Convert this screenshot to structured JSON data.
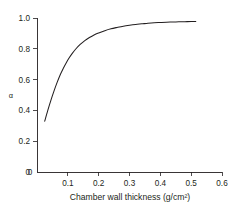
{
  "chart_data": {
    "type": "line",
    "title": "",
    "subtitle": "",
    "xlabel": "Chamber wall thickness (g/cm²)",
    "ylabel": "α",
    "xlim": [
      0.0,
      0.6
    ],
    "ylim": [
      0.0,
      1.0
    ],
    "xticks": [
      0.0,
      0.1,
      0.2,
      0.3,
      0.4,
      0.5,
      0.6
    ],
    "xtick_labels": [
      "0",
      "0.1",
      "0.2",
      "0.3",
      "0.4",
      "0.5",
      "0.6"
    ],
    "yticks": [
      0.0,
      0.2,
      0.4,
      0.6,
      0.8,
      1.0
    ],
    "ytick_labels": [
      "0",
      "0.2",
      "0.4",
      "0.6",
      "0.8",
      "1.0"
    ],
    "grid": false,
    "legend": false,
    "legend_position": "none",
    "series": [
      {
        "name": "alpha vs chamber wall thickness",
        "color": "#231f20",
        "x": [
          0.025,
          0.035,
          0.045,
          0.055,
          0.065,
          0.075,
          0.085,
          0.095,
          0.105,
          0.115,
          0.125,
          0.14,
          0.155,
          0.17,
          0.185,
          0.2,
          0.22,
          0.24,
          0.26,
          0.28,
          0.3,
          0.32,
          0.34,
          0.36,
          0.38,
          0.4,
          0.42,
          0.44,
          0.46,
          0.48,
          0.5,
          0.515
        ],
        "y": [
          0.33,
          0.4,
          0.465,
          0.525,
          0.58,
          0.63,
          0.672,
          0.71,
          0.743,
          0.772,
          0.797,
          0.828,
          0.853,
          0.873,
          0.89,
          0.903,
          0.918,
          0.93,
          0.939,
          0.947,
          0.953,
          0.958,
          0.962,
          0.966,
          0.969,
          0.971,
          0.973,
          0.974,
          0.975,
          0.976,
          0.977,
          0.977
        ]
      }
    ]
  },
  "axis_geometry": {
    "plot_left_px": 37,
    "plot_right_px": 222,
    "plot_top_px": 18,
    "plot_bottom_px": 172
  }
}
